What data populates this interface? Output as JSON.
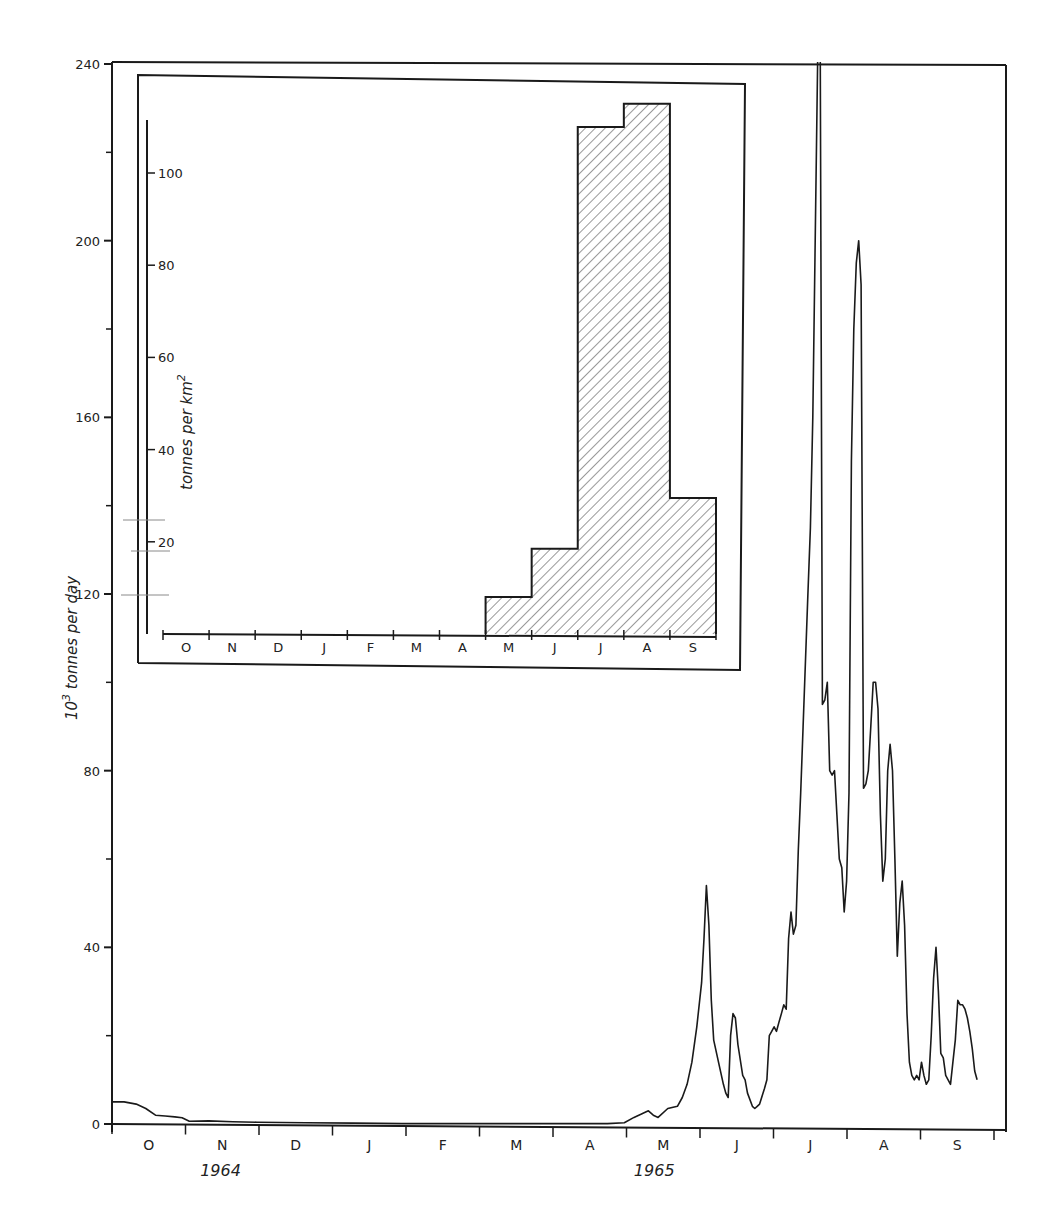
{
  "chart_data": [
    {
      "id": "main",
      "type": "line",
      "title": "",
      "xlabel": "",
      "ylabel": "10^3 tonnes per day",
      "ylabel_base": "10",
      "ylabel_exp": "3",
      "ylabel_rest": " tonnes per day",
      "ylim": [
        0,
        240
      ],
      "yticks": [
        0,
        40,
        80,
        120,
        160,
        200,
        240
      ],
      "yminor_ticks": [
        20,
        60,
        100,
        140,
        180,
        220
      ],
      "months": [
        "O",
        "N",
        "D",
        "J",
        "F",
        "M",
        "A",
        "M",
        "J",
        "J",
        "A",
        "S"
      ],
      "years": [
        {
          "label": "1964",
          "month_index": 1
        },
        {
          "label": "1965",
          "month_index": 7
        }
      ],
      "grid": false,
      "note": "Daily suspended sediment discharge, Oct 1964 - Sep 1965; July peak exceeds 240 (off-scale)",
      "series": [
        {
          "name": "daily sediment load",
          "points": [
            [
              0,
              5
            ],
            [
              5,
              5
            ],
            [
              10,
              4.5
            ],
            [
              14,
              3.5
            ],
            [
              18,
              2
            ],
            [
              22,
              1.8
            ],
            [
              26,
              1.6
            ],
            [
              29,
              1.4
            ],
            [
              32,
              0.6
            ],
            [
              40,
              0.7
            ],
            [
              50,
              0.5
            ],
            [
              60,
              0.4
            ],
            [
              80,
              0.3
            ],
            [
              100,
              0.2
            ],
            [
              120,
              0.1
            ],
            [
              150,
              0.1
            ],
            [
              180,
              0.1
            ],
            [
              205,
              0.1
            ],
            [
              212,
              0.3
            ],
            [
              216,
              1.5
            ],
            [
              220,
              2.5
            ],
            [
              222,
              3
            ],
            [
              224,
              2
            ],
            [
              226,
              1.5
            ],
            [
              230,
              3.5
            ],
            [
              234,
              4
            ],
            [
              236,
              6
            ],
            [
              238,
              9
            ],
            [
              240,
              14
            ],
            [
              242,
              22
            ],
            [
              244,
              32
            ],
            [
              245,
              42
            ],
            [
              246,
              54
            ],
            [
              247,
              45
            ],
            [
              248,
              28
            ],
            [
              249,
              19
            ],
            [
              251,
              14
            ],
            [
              253,
              9
            ],
            [
              254,
              7
            ],
            [
              255,
              6
            ],
            [
              256,
              20
            ],
            [
              257,
              25
            ],
            [
              258,
              24
            ],
            [
              259,
              18
            ],
            [
              261,
              11
            ],
            [
              262,
              10
            ],
            [
              263,
              7
            ],
            [
              265,
              4
            ],
            [
              266,
              3.5
            ],
            [
              267,
              4
            ],
            [
              268,
              4.5
            ],
            [
              270,
              8
            ],
            [
              271,
              10
            ],
            [
              272,
              20
            ],
            [
              273,
              21
            ],
            [
              274,
              22
            ],
            [
              275,
              21
            ],
            [
              276,
              23
            ],
            [
              277,
              25
            ],
            [
              278,
              27
            ],
            [
              279,
              26
            ],
            [
              280,
              42
            ],
            [
              281,
              48
            ],
            [
              282,
              43
            ],
            [
              283,
              45
            ],
            [
              284,
              62
            ],
            [
              285,
              75
            ],
            [
              286,
              90
            ],
            [
              288,
              120
            ],
            [
              289,
              135
            ],
            [
              290,
              160
            ],
            [
              291,
              200
            ],
            [
              292,
              240
            ],
            [
              293,
              260
            ],
            [
              294,
              95
            ],
            [
              295,
              96
            ],
            [
              296,
              100
            ],
            [
              297,
              80
            ],
            [
              298,
              79
            ],
            [
              299,
              80
            ],
            [
              300,
              70
            ],
            [
              301,
              60
            ],
            [
              302,
              58
            ],
            [
              303,
              48
            ],
            [
              304,
              55
            ],
            [
              305,
              75
            ],
            [
              306,
              150
            ],
            [
              307,
              180
            ],
            [
              308,
              195
            ],
            [
              309,
              200
            ],
            [
              310,
              190
            ],
            [
              311,
              76
            ],
            [
              312,
              77
            ],
            [
              313,
              80
            ],
            [
              314,
              90
            ],
            [
              315,
              100
            ],
            [
              316,
              100
            ],
            [
              317,
              94
            ],
            [
              318,
              70
            ],
            [
              319,
              55
            ],
            [
              320,
              60
            ],
            [
              321,
              80
            ],
            [
              322,
              86
            ],
            [
              323,
              80
            ],
            [
              324,
              60
            ],
            [
              325,
              38
            ],
            [
              326,
              50
            ],
            [
              327,
              55
            ],
            [
              328,
              45
            ],
            [
              329,
              25
            ],
            [
              330,
              14
            ],
            [
              331,
              11
            ],
            [
              332,
              10
            ],
            [
              333,
              11
            ],
            [
              334,
              10
            ],
            [
              335,
              14
            ],
            [
              336,
              11
            ],
            [
              337,
              9
            ],
            [
              338,
              10
            ],
            [
              339,
              20
            ],
            [
              340,
              33
            ],
            [
              341,
              40
            ],
            [
              342,
              30
            ],
            [
              343,
              16
            ],
            [
              344,
              15
            ],
            [
              345,
              11
            ],
            [
              346,
              10
            ],
            [
              347,
              9
            ],
            [
              348,
              14
            ],
            [
              349,
              19
            ],
            [
              350,
              28
            ],
            [
              351,
              27
            ],
            [
              352,
              27
            ],
            [
              353,
              26
            ],
            [
              354,
              24
            ],
            [
              355,
              21
            ],
            [
              356,
              17
            ],
            [
              357,
              12
            ],
            [
              358,
              10
            ]
          ]
        }
      ]
    },
    {
      "id": "inset",
      "type": "bar",
      "title": "",
      "xlabel": "",
      "ylabel": "tonnes per km^2",
      "ylabel_base": "tonnes per km",
      "ylabel_exp": "2",
      "ylim": [
        0,
        120
      ],
      "yticks": [
        20,
        40,
        60,
        80,
        100
      ],
      "categories": [
        "O",
        "N",
        "D",
        "J",
        "F",
        "M",
        "A",
        "M",
        "J",
        "J",
        "A",
        "S"
      ],
      "values": [
        0,
        0,
        0,
        0,
        0,
        0,
        0,
        8,
        18.5,
        110,
        115,
        29.5
      ],
      "fill": "diagonal hatch",
      "grid": false
    }
  ],
  "colors": {
    "ink": "#1a1a1a",
    "paper": "#ffffff",
    "faint_rule": "#8a8a8a"
  }
}
